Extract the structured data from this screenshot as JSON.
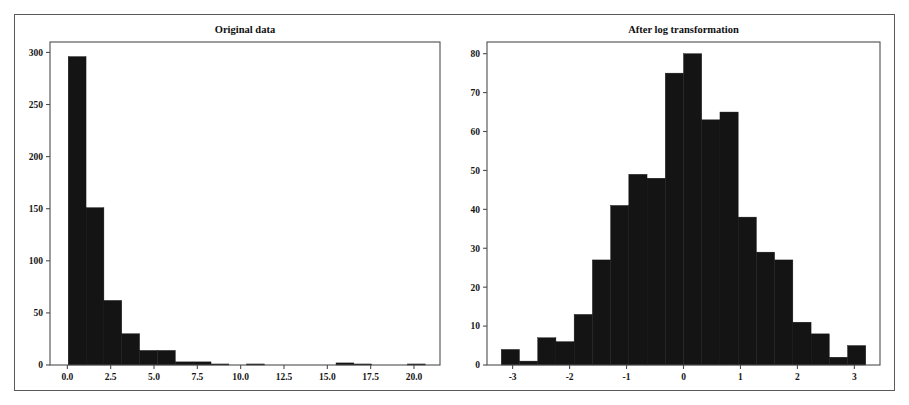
{
  "figure": {
    "width": 909,
    "height": 405,
    "background_color": "#ffffff",
    "border_color": "#5a5a5a",
    "bar_color": "#141414",
    "axis_color": "#4d4d4d",
    "panel_count": 2
  },
  "chart_data": [
    {
      "type": "bar",
      "subtype": "histogram",
      "panel": "left",
      "title": "Original data",
      "xlabel": "",
      "ylabel": "",
      "grid": false,
      "legend": null,
      "xlim": [
        -1.0,
        21.5
      ],
      "ylim": [
        0,
        310
      ],
      "xticks": [
        0.0,
        2.5,
        5.0,
        7.5,
        10.0,
        12.5,
        15.0,
        17.5,
        20.0
      ],
      "xticklabels": [
        "0.0",
        "2.5",
        "5.0",
        "7.5",
        "10.0",
        "12.5",
        "15.0",
        "17.5",
        "20.0"
      ],
      "yticks": [
        0,
        50,
        100,
        150,
        200,
        250,
        300
      ],
      "yticklabels": [
        "0",
        "50",
        "100",
        "150",
        "200",
        "250",
        "300"
      ],
      "bin_edges": [
        0.05,
        1.08,
        2.11,
        3.14,
        4.17,
        5.2,
        6.23,
        7.26,
        8.29,
        9.32,
        10.35,
        11.38,
        12.41,
        13.44,
        14.47,
        15.5,
        16.53,
        17.56,
        18.59,
        19.62,
        20.65
      ],
      "values": [
        296,
        151,
        62,
        30,
        14,
        14,
        3,
        3,
        1,
        0,
        1,
        0,
        0,
        0,
        0,
        2,
        1,
        0,
        0,
        1
      ]
    },
    {
      "type": "bar",
      "subtype": "histogram",
      "panel": "right",
      "title": "After log transformation",
      "xlabel": "",
      "ylabel": "",
      "grid": false,
      "legend": null,
      "xlim": [
        -3.45,
        3.45
      ],
      "ylim": [
        0,
        83
      ],
      "xticks": [
        -3,
        -2,
        -1,
        0,
        1,
        2,
        3
      ],
      "xticklabels": [
        "-3",
        "-2",
        "-1",
        "0",
        "1",
        "2",
        "3"
      ],
      "yticks": [
        0,
        10,
        20,
        30,
        40,
        50,
        60,
        70,
        80
      ],
      "yticklabels": [
        "0",
        "10",
        "20",
        "30",
        "40",
        "50",
        "60",
        "70",
        "80"
      ],
      "bin_edges": [
        -3.2,
        -2.88,
        -2.56,
        -2.24,
        -1.92,
        -1.6,
        -1.28,
        -0.96,
        -0.64,
        -0.32,
        0.0,
        0.32,
        0.64,
        0.96,
        1.28,
        1.6,
        1.92,
        2.24,
        2.56,
        2.88,
        3.2
      ],
      "values": [
        4,
        1,
        7,
        6,
        13,
        27,
        41,
        49,
        48,
        75,
        80,
        63,
        65,
        38,
        29,
        27,
        11,
        8,
        2,
        5
      ]
    }
  ]
}
